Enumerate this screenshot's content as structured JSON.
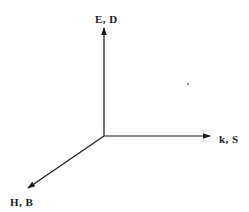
{
  "diagram": {
    "type": "3d-coordinate-axes",
    "origin": {
      "x": 104,
      "y": 136
    },
    "axes": [
      {
        "id": "vertical",
        "label": "E, D",
        "direction": "up",
        "tip": {
          "x": 104,
          "y": 28
        }
      },
      {
        "id": "horizontal",
        "label": "k, S",
        "direction": "right",
        "tip": {
          "x": 210,
          "y": 136
        }
      },
      {
        "id": "diagonal",
        "label": "H, B",
        "direction": "down-left",
        "tip": {
          "x": 28,
          "y": 188
        }
      }
    ],
    "colors": {
      "line": "#1a1a1a",
      "text": "#1a1a1a",
      "background": "#ffffff",
      "dot": "#9a9a9a"
    }
  }
}
